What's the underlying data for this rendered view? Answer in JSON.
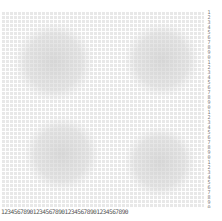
{
  "caption": "",
  "pattern": {
    "description": "halftone dot grid with four soft circular blobs",
    "grid_color": "#e6e6e6",
    "blob_color": "#d4d4d4",
    "background": "#ffffff",
    "blobs": [
      "top-left",
      "top-right",
      "bottom-left",
      "bottom-right"
    ]
  },
  "rulers": {
    "bottom": "1234567890123456789012345678901234567890",
    "right": "1234567890123456789012345678901234567890"
  }
}
